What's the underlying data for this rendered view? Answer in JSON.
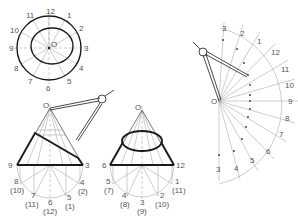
{
  "figure": {
    "top_view": {
      "center_label": "O",
      "clock_labels": [
        "12",
        "1",
        "2",
        "3",
        "4",
        "5",
        "6",
        "7",
        "8",
        "9",
        "10",
        "11"
      ]
    },
    "cone_left": {
      "apex_label": "O",
      "base_left": "9",
      "base_right": "3",
      "bottom_labels": [
        {
          "main": "8",
          "alt": "(10)"
        },
        {
          "main": "7",
          "alt": "(11)"
        },
        {
          "main": "6",
          "alt": "(12)"
        },
        {
          "main": "5",
          "alt": "(1)"
        },
        {
          "main": "4",
          "alt": "(2)"
        }
      ]
    },
    "cone_right": {
      "apex_label": "O",
      "base_left": "6",
      "base_right": "12",
      "bottom_labels": [
        {
          "main": "5",
          "alt": "(7)"
        },
        {
          "main": "4",
          "alt": "(8)"
        },
        {
          "main": "3",
          "alt": "(9)"
        },
        {
          "main": "2",
          "alt": "(10)"
        },
        {
          "main": "1",
          "alt": "(11)"
        }
      ]
    },
    "development": {
      "center_label": "O",
      "arc_labels": [
        "3",
        "2",
        "1",
        "12",
        "11",
        "10",
        "9",
        "8",
        "7",
        "6",
        "5",
        "4",
        "3"
      ]
    }
  }
}
